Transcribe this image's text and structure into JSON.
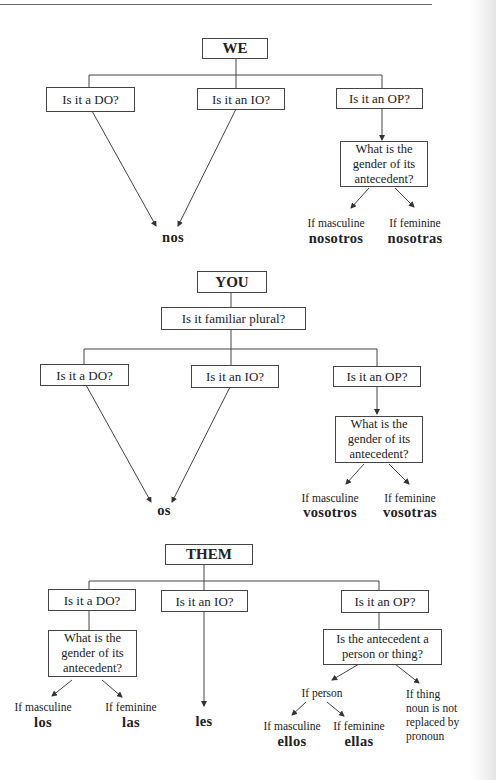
{
  "we": {
    "title": "WE",
    "q_do": "Is it a DO?",
    "q_io": "Is it an IO?",
    "q_op": "Is it an OP?",
    "q_gender": "What is the\ngender of its\nantecedent?",
    "ans_do_io": "nos",
    "if_masc": "If masculine",
    "ans_masc": "nosotros",
    "if_fem": "If  feminine",
    "ans_fem": "nosotras"
  },
  "you": {
    "title": "YOU",
    "q_familiar": "Is it familiar plural?",
    "q_do": "Is it a DO?",
    "q_io": "Is it an IO?",
    "q_op": "Is it an OP?",
    "q_gender": "What is the\ngender of its\nantecedent?",
    "ans_do_io": "os",
    "if_masc": "If masculine",
    "ans_masc": "vosotros",
    "if_fem": "If  feminine",
    "ans_fem": "vosotras"
  },
  "them": {
    "title": "THEM",
    "q_do": "Is it a DO?",
    "q_io": "Is it an IO?",
    "q_op": "Is it an OP?",
    "q_gender": "What is the\ngender of its\nantecedent?",
    "do_if_masc": "If masculine",
    "do_ans_masc": "los",
    "do_if_fem": "If  feminine",
    "do_ans_fem": "las",
    "ans_io": "les",
    "q_person_thing": "Is the antecedent a\nperson or thing?",
    "if_person": "If person",
    "op_if_masc": "If masculine",
    "op_ans_masc": "ellos",
    "op_if_fem": "If feminine",
    "op_ans_fem": "ellas",
    "if_thing": "If thing",
    "thing_note": "  noun is not\n  replaced by\n  pronoun"
  }
}
